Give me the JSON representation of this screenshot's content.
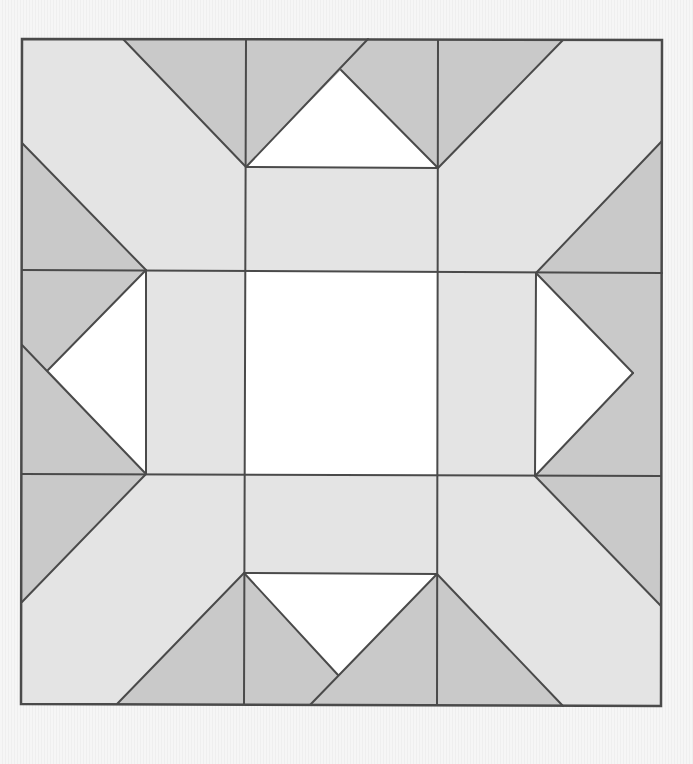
{
  "figure": {
    "type": "quilt-block-diagram",
    "width": 693,
    "height": 764
  },
  "colors": {
    "background": "#f4f4f4",
    "light_fabric": "#e4e4e4",
    "dark_fabric": "#c9c9c9",
    "white_fabric": "#ffffff",
    "seam_line": "#4a4a4a"
  },
  "stroke_width": 2,
  "border": {
    "points": [
      [
        22,
        39
      ],
      [
        662,
        40
      ],
      [
        661,
        706
      ],
      [
        21,
        704
      ]
    ]
  },
  "patches": [
    {
      "name": "light-background",
      "fill": "light",
      "points": [
        [
          22,
          39
        ],
        [
          662,
          40
        ],
        [
          661,
          706
        ],
        [
          21,
          704
        ]
      ]
    },
    {
      "name": "center-square",
      "fill": "white",
      "points": [
        [
          245,
          271
        ],
        [
          438,
          272
        ],
        [
          437,
          475
        ],
        [
          245,
          474
        ]
      ]
    },
    {
      "name": "top-dark-left-triangle",
      "fill": "dark",
      "points": [
        [
          123,
          39
        ],
        [
          246,
          39
        ],
        [
          246,
          167
        ]
      ]
    },
    {
      "name": "top-dark-center-left",
      "fill": "dark",
      "points": [
        [
          246,
          39
        ],
        [
          368,
          39
        ],
        [
          341,
          70
        ],
        [
          246,
          167
        ]
      ]
    },
    {
      "name": "top-dark-center-right",
      "fill": "dark",
      "points": [
        [
          368,
          39
        ],
        [
          438,
          40
        ],
        [
          438,
          168
        ],
        [
          341,
          70
        ]
      ]
    },
    {
      "name": "top-dark-right-triangle",
      "fill": "dark",
      "points": [
        [
          438,
          40
        ],
        [
          563,
          40
        ],
        [
          438,
          168
        ]
      ]
    },
    {
      "name": "top-white-triangle",
      "fill": "white",
      "points": [
        [
          246,
          167
        ],
        [
          341,
          70
        ],
        [
          438,
          168
        ]
      ]
    },
    {
      "name": "left-dark-upper-triangle",
      "fill": "dark",
      "points": [
        [
          22,
          143
        ],
        [
          146,
          270
        ],
        [
          22,
          270
        ]
      ]
    },
    {
      "name": "left-dark-middle-upper",
      "fill": "dark",
      "points": [
        [
          22,
          270
        ],
        [
          146,
          270
        ],
        [
          48,
          370
        ],
        [
          22,
          345
        ]
      ]
    },
    {
      "name": "left-dark-middle-lower",
      "fill": "dark",
      "points": [
        [
          22,
          345
        ],
        [
          48,
          370
        ],
        [
          146,
          474
        ],
        [
          22,
          474
        ]
      ]
    },
    {
      "name": "left-dark-lower-triangle",
      "fill": "dark",
      "points": [
        [
          22,
          474
        ],
        [
          146,
          474
        ],
        [
          22,
          602
        ]
      ]
    },
    {
      "name": "left-white-triangle",
      "fill": "white",
      "points": [
        [
          146,
          270
        ],
        [
          48,
          370
        ],
        [
          146,
          474
        ]
      ]
    },
    {
      "name": "right-dark-upper-triangle",
      "fill": "dark",
      "points": [
        [
          662,
          141
        ],
        [
          662,
          273
        ],
        [
          536,
          273
        ]
      ]
    },
    {
      "name": "right-dark-middle",
      "fill": "dark",
      "points": [
        [
          536,
          273
        ],
        [
          662,
          273
        ],
        [
          661,
          476
        ],
        [
          535,
          476
        ],
        [
          633,
          373
        ]
      ]
    },
    {
      "name": "right-dark-lower-triangle",
      "fill": "dark",
      "points": [
        [
          535,
          476
        ],
        [
          661,
          476
        ],
        [
          661,
          606
        ]
      ]
    },
    {
      "name": "right-white-triangle",
      "fill": "white",
      "points": [
        [
          536,
          273
        ],
        [
          633,
          373
        ],
        [
          535,
          476
        ]
      ]
    },
    {
      "name": "bottom-dark-left-triangle",
      "fill": "dark",
      "points": [
        [
          244,
          573
        ],
        [
          244,
          704
        ],
        [
          117,
          704
        ]
      ]
    },
    {
      "name": "bottom-dark-center-left",
      "fill": "dark",
      "points": [
        [
          244,
          573
        ],
        [
          338,
          675
        ],
        [
          310,
          705
        ],
        [
          244,
          704
        ]
      ]
    },
    {
      "name": "bottom-dark-center-right",
      "fill": "dark",
      "points": [
        [
          437,
          574
        ],
        [
          437,
          705
        ],
        [
          310,
          705
        ]
      ]
    },
    {
      "name": "bottom-dark-right-triangle",
      "fill": "dark",
      "points": [
        [
          437,
          574
        ],
        [
          563,
          706
        ],
        [
          437,
          705
        ]
      ]
    },
    {
      "name": "bottom-white-triangle",
      "fill": "white",
      "points": [
        [
          244,
          573
        ],
        [
          437,
          574
        ],
        [
          338,
          675
        ]
      ]
    }
  ],
  "seams": [
    {
      "name": "top-left-diagonal",
      "from": [
        123,
        39
      ],
      "to": [
        246,
        167
      ]
    },
    {
      "name": "top-right-diagonal",
      "from": [
        563,
        40
      ],
      "to": [
        438,
        168
      ]
    },
    {
      "name": "top-white-left-edge-extended",
      "from": [
        246,
        167
      ],
      "to": [
        368,
        39
      ]
    },
    {
      "name": "top-white-right-edge",
      "from": [
        341,
        70
      ],
      "to": [
        438,
        168
      ]
    },
    {
      "name": "top-white-base",
      "from": [
        246,
        167
      ],
      "to": [
        438,
        168
      ]
    },
    {
      "name": "vertical-left-inner",
      "from": [
        246,
        39
      ],
      "to": [
        244,
        704
      ]
    },
    {
      "name": "vertical-right-inner",
      "from": [
        438,
        40
      ],
      "to": [
        437,
        705
      ]
    },
    {
      "name": "horizontal-upper",
      "from": [
        22,
        270
      ],
      "to": [
        662,
        273
      ]
    },
    {
      "name": "horizontal-lower",
      "from": [
        22,
        474
      ],
      "to": [
        661,
        476
      ]
    },
    {
      "name": "left-column-edge",
      "from": [
        146,
        270
      ],
      "to": [
        146,
        474
      ]
    },
    {
      "name": "right-column-edge",
      "from": [
        536,
        273
      ],
      "to": [
        535,
        476
      ]
    },
    {
      "name": "left-upper-diagonal",
      "from": [
        22,
        143
      ],
      "to": [
        146,
        270
      ]
    },
    {
      "name": "left-white-upper-edge",
      "from": [
        146,
        270
      ],
      "to": [
        48,
        370
      ]
    },
    {
      "name": "left-white-lower-edge-extended",
      "from": [
        22,
        345
      ],
      "to": [
        146,
        474
      ]
    },
    {
      "name": "left-lower-diagonal",
      "from": [
        146,
        474
      ],
      "to": [
        22,
        602
      ]
    },
    {
      "name": "right-upper-diagonal",
      "from": [
        536,
        273
      ],
      "to": [
        662,
        141
      ]
    },
    {
      "name": "right-white-upper-edge",
      "from": [
        536,
        273
      ],
      "to": [
        633,
        373
      ]
    },
    {
      "name": "right-white-lower-edge",
      "from": [
        633,
        373
      ],
      "to": [
        535,
        476
      ]
    },
    {
      "name": "right-lower-diagonal",
      "from": [
        535,
        476
      ],
      "to": [
        661,
        606
      ]
    },
    {
      "name": "bottom-white-top",
      "from": [
        244,
        573
      ],
      "to": [
        437,
        574
      ]
    },
    {
      "name": "bottom-white-left-edge",
      "from": [
        244,
        573
      ],
      "to": [
        338,
        675
      ]
    },
    {
      "name": "bottom-white-right-edge-extended",
      "from": [
        437,
        574
      ],
      "to": [
        310,
        705
      ]
    },
    {
      "name": "bottom-left-diagonal",
      "from": [
        244,
        573
      ],
      "to": [
        117,
        704
      ]
    },
    {
      "name": "bottom-right-diagonal",
      "from": [
        437,
        574
      ],
      "to": [
        563,
        706
      ]
    }
  ]
}
